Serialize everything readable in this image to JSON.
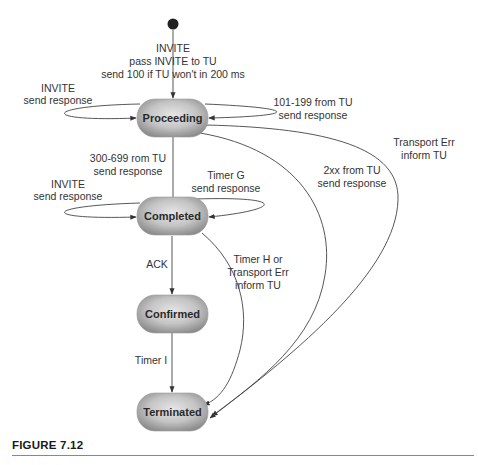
{
  "figure": {
    "caption": "FIGURE 7.12"
  },
  "colors": {
    "node_light": "#e4e4e4",
    "node_dark": "#8e8e8e",
    "edge": "#444444",
    "text": "#333333"
  },
  "nodes": {
    "initial": {
      "type": "start-dot"
    },
    "proceeding": {
      "label": "Proceeding"
    },
    "completed": {
      "label": "Completed"
    },
    "confirmed": {
      "label": "Confirmed"
    },
    "terminated": {
      "label": "Terminated"
    }
  },
  "edges": {
    "start_to_proceeding": {
      "line1": "INVITE",
      "line2": "pass INVITE to TU",
      "line3": "send 100 if TU won't in 200 ms"
    },
    "proceeding_self_invite": {
      "line1": "INVITE",
      "line2": "send response"
    },
    "proceeding_self_1xx": {
      "line1": "101-199 from TU",
      "line2": "send response"
    },
    "proceeding_to_completed": {
      "line1": "300-699 rom TU",
      "line2": "send response"
    },
    "proceeding_to_terminated_2xx": {
      "line1": "2xx from TU",
      "line2": "send response"
    },
    "proceeding_to_terminated_transport": {
      "line1": "Transport Err",
      "line2": "inform TU"
    },
    "completed_self_invite": {
      "line1": "INVITE",
      "line2": "send response"
    },
    "completed_self_timer_g": {
      "line1": "Timer G",
      "line2": "send response"
    },
    "completed_to_confirmed": {
      "line1": "ACK"
    },
    "completed_to_terminated": {
      "line1": "Timer H or",
      "line2": "Transport Err",
      "line3": "inform TU"
    },
    "confirmed_to_terminated": {
      "line1": "Timer I"
    }
  }
}
